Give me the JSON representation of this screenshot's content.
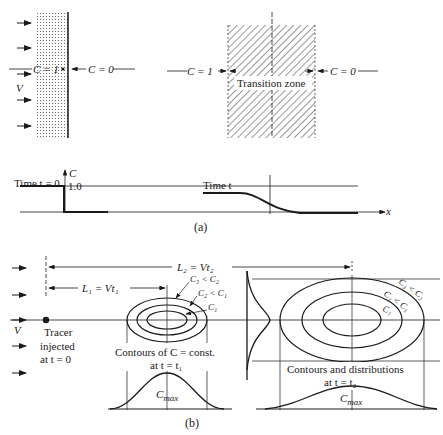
{
  "panel_a": {
    "top_left": {
      "c_left": "C = 1",
      "c_right": "C = 0",
      "v_label": "V"
    },
    "top_right": {
      "c_left": "C = 1",
      "c_right": "C = 0",
      "zone_label": "Transition zone"
    },
    "plot": {
      "y_axis_label": "C",
      "y_value": "1.0",
      "time0_label": "Time t = 0",
      "timet_label": "Time t",
      "x_axis_label": "x"
    },
    "caption": "(a)"
  },
  "panel_b": {
    "v_label": "V",
    "L2_label": "L₂ = Vt₂",
    "L1_label": "L₁ = Vt₁",
    "tracer_line1": "Tracer",
    "tracer_line2": "injected",
    "tracer_line3": "at t = 0",
    "contour_labels_t1": [
      "C₃ < C₂",
      "C₂ < C₁",
      "C₁"
    ],
    "contour_labels_t2": [
      "C₃ < C₂",
      "C₂ < C₁",
      "C₁"
    ],
    "contours_t1_line1": "Contours of C = const.",
    "contours_t1_line2": "at t = t₁",
    "contours_t2_line1": "Contours and distributions",
    "contours_t2_line2": "at t = t₂",
    "cmax_label": "C",
    "cmax_sub": "max",
    "caption": "(b)"
  }
}
